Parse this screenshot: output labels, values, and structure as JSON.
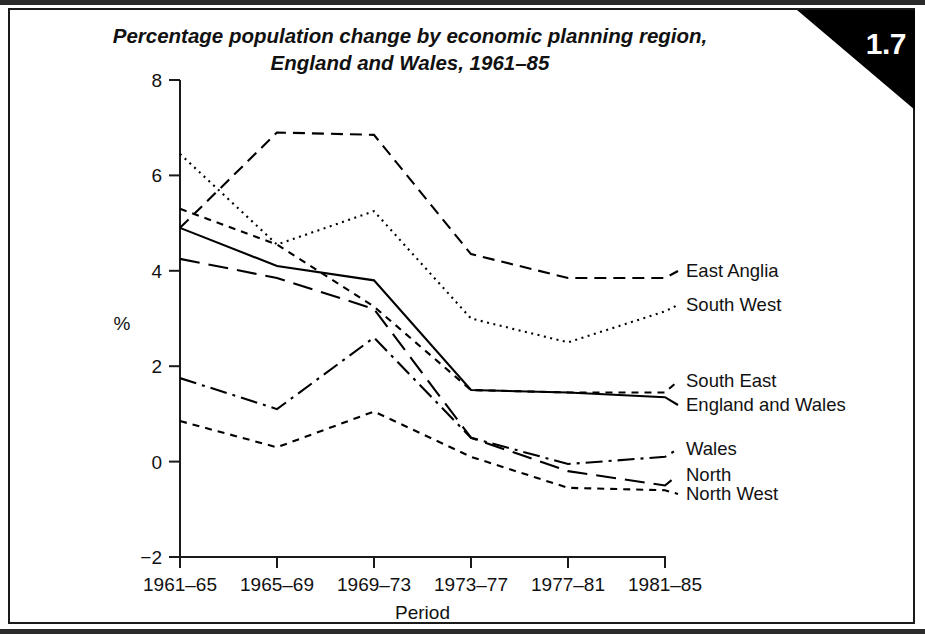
{
  "figure": {
    "number": "1.7",
    "title_line1": "Percentage population change by economic planning region,",
    "title_line2": "England and Wales, 1961–85"
  },
  "chart_data": {
    "type": "line",
    "title": "Percentage population change by economic planning region, England and Wales, 1961–85",
    "xlabel": "Period",
    "ylabel": "%",
    "categories": [
      "1961–65",
      "1965–69",
      "1969–73",
      "1973–77",
      "1977–81",
      "1981–85"
    ],
    "xtick_labels": [
      "1961–65",
      "1965–69",
      "1969–73",
      "1973–77",
      "1977–81",
      "1981–85"
    ],
    "ytick_labels": [
      "−2",
      "0",
      "2",
      "4",
      "6",
      "8"
    ],
    "ytick_values": [
      -2,
      0,
      2,
      4,
      6,
      8
    ],
    "ylim": [
      -2,
      8
    ],
    "grid": false,
    "legend_position": "right-inline",
    "series": [
      {
        "name": "East Anglia",
        "dash": "medium-dash",
        "values": [
          4.9,
          6.9,
          6.85,
          4.35,
          3.85,
          3.85
        ]
      },
      {
        "name": "South West",
        "dash": "dotted",
        "values": [
          6.45,
          4.55,
          5.25,
          3.0,
          2.5,
          3.15
        ]
      },
      {
        "name": "South East",
        "dash": "short-dash",
        "values": [
          5.3,
          4.55,
          3.25,
          1.5,
          1.45,
          1.45
        ]
      },
      {
        "name": "England and Wales",
        "dash": "solid",
        "values": [
          4.9,
          4.1,
          3.8,
          1.5,
          1.45,
          1.35
        ]
      },
      {
        "name": "Wales",
        "dash": "dash-dot",
        "values": [
          1.75,
          1.1,
          2.6,
          0.5,
          -0.05,
          0.1
        ]
      },
      {
        "name": "North",
        "dash": "long-dash",
        "values": [
          4.25,
          3.85,
          3.2,
          0.5,
          -0.2,
          -0.5
        ]
      },
      {
        "name": "North West",
        "dash": "short-dash",
        "values": [
          0.85,
          0.3,
          1.05,
          0.1,
          -0.55,
          -0.6
        ]
      }
    ]
  },
  "legend": {
    "items": [
      {
        "label": "East Anglia"
      },
      {
        "label": "South West"
      },
      {
        "label": "South East"
      },
      {
        "label": "England and Wales"
      },
      {
        "label": "Wales"
      },
      {
        "label": "North"
      },
      {
        "label": "North West"
      }
    ]
  },
  "colors": {
    "ink": "#000000",
    "frame": "#1a1a1a",
    "badge_bg": "#000000",
    "badge_text": "#ffffff",
    "page_bg": "#ffffff"
  }
}
